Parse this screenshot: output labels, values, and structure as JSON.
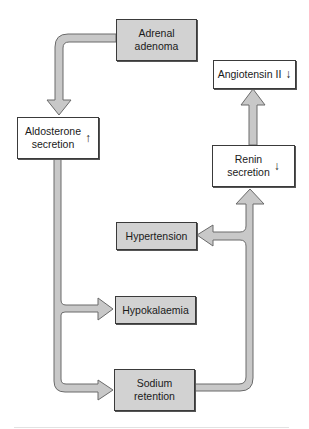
{
  "diagram": {
    "colors": {
      "arrow_fill": "#c8c8c8",
      "arrow_stroke": "#6a6a6a",
      "grey_box": "#d2d2d2",
      "white_box": "#ffffff",
      "border": "#3a3a3a"
    },
    "nodes": {
      "adrenal_adenoma": {
        "label": "Adrenal adenoma",
        "line1": "Adrenal",
        "line2": "adenoma",
        "style": "grey"
      },
      "aldosterone": {
        "label": "Aldosterone secretion",
        "line1": "Aldosterone",
        "line2": "secretion",
        "indicator": "↑",
        "style": "white"
      },
      "angiotensin": {
        "label": "Angiotensin II",
        "line1": "Angiotensin II",
        "indicator": "↓",
        "style": "white"
      },
      "renin": {
        "label": "Renin secretion",
        "line1": "Renin",
        "line2": "secretion",
        "indicator": "↓",
        "style": "white"
      },
      "hypertension": {
        "label": "Hypertension",
        "line1": "Hypertension",
        "style": "grey"
      },
      "hypokalaemia": {
        "label": "Hypokalaemia",
        "line1": "Hypokalaemia",
        "style": "grey"
      },
      "sodium": {
        "label": "Sodium retention",
        "line1": "Sodium",
        "line2": "retention",
        "style": "grey"
      }
    },
    "edges": [
      {
        "from": "Adrenal adenoma",
        "to": "Aldosterone secretion"
      },
      {
        "from": "Aldosterone secretion",
        "to": "Hypokalaemia"
      },
      {
        "from": "Aldosterone secretion",
        "to": "Sodium retention"
      },
      {
        "from": "Sodium retention",
        "to": "Renin secretion"
      },
      {
        "from": "Sodium retention",
        "to": "Hypertension"
      },
      {
        "from": "Renin secretion",
        "to": "Angiotensin II"
      }
    ]
  }
}
